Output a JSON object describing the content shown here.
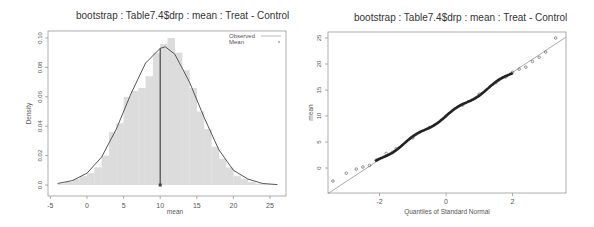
{
  "chart_data": [
    {
      "type": "bar",
      "subtype": "histogram_with_density",
      "title": "bootstrap : Table7.4$drp : mean : Treat - Control",
      "xlabel": "mean",
      "ylabel": "Density",
      "xlim": [
        -5,
        27
      ],
      "ylim": [
        0,
        0.104
      ],
      "x_ticks": [
        "-5",
        "0",
        "5",
        "10",
        "15",
        "20",
        "25"
      ],
      "y_ticks": [
        "0.0",
        "0.02",
        "0.04",
        "0.06",
        "0.08",
        "0.10"
      ],
      "grid": false,
      "legend": {
        "position": "top-right",
        "entries": [
          "Observed",
          "Mean"
        ]
      },
      "bins": [
        -4,
        -3,
        -2,
        -1,
        0,
        1,
        2,
        3,
        4,
        5,
        6,
        7,
        8,
        9,
        10,
        11,
        12,
        13,
        14,
        15,
        16,
        17,
        18,
        19,
        20,
        21,
        22,
        23,
        24,
        25
      ],
      "values": [
        0.001,
        0.002,
        0.004,
        0.006,
        0.008,
        0.012,
        0.02,
        0.036,
        0.042,
        0.06,
        0.064,
        0.066,
        0.074,
        0.09,
        0.096,
        0.1,
        0.09,
        0.078,
        0.066,
        0.05,
        0.038,
        0.026,
        0.018,
        0.012,
        0.006,
        0.004,
        0.002,
        0.001,
        0.0005,
        0.0003
      ],
      "density_curve": {
        "x": [
          -4,
          -2,
          0,
          2,
          4,
          6,
          8,
          10,
          10.7,
          12,
          14,
          16,
          18,
          20,
          22,
          24,
          26
        ],
        "y": [
          0.001,
          0.003,
          0.008,
          0.019,
          0.038,
          0.062,
          0.083,
          0.093,
          0.094,
          0.089,
          0.07,
          0.046,
          0.024,
          0.01,
          0.004,
          0.001,
          0.0003
        ]
      },
      "observed": 10,
      "mean": 10
    },
    {
      "type": "scatter",
      "subtype": "qq_plot",
      "title": "bootstrap : Table7.4$drp : mean : Treat - Control",
      "xlabel": "Quantiles of Standard Normal",
      "ylabel": "mean",
      "xlim": [
        -3.6,
        3.6
      ],
      "ylim": [
        -3.5,
        26
      ],
      "x_ticks": [
        "-2",
        "0",
        "2"
      ],
      "y_ticks": [
        "0",
        "5",
        "10",
        "15",
        "20",
        "25"
      ],
      "grid": false,
      "reference_line": {
        "intercept": 10,
        "slope": 4.2
      },
      "points": {
        "x": [
          -3.4,
          -3.0,
          -2.7,
          -2.5,
          -2.3,
          -2.1,
          -1.8,
          -1.5,
          -1.0,
          -0.5,
          0,
          0.5,
          1.0,
          1.5,
          1.8,
          2.0,
          2.2,
          2.4,
          2.6,
          2.8,
          3.0,
          3.3
        ],
        "y": [
          -2.5,
          -1.0,
          -0.2,
          0.2,
          0.5,
          1.5,
          2.8,
          3.7,
          5.8,
          7.8,
          10,
          12.1,
          14.2,
          16.4,
          17.5,
          18.4,
          19.0,
          19.4,
          20.5,
          21.3,
          22.3,
          25.0
        ]
      }
    }
  ],
  "left": {
    "title": "bootstrap : Table7.4$drp : mean : Treat - Control",
    "xlabel": "mean",
    "ylabel": "Density",
    "legend": {
      "observed": "Observed",
      "mean": "Mean"
    }
  },
  "right": {
    "title": "bootstrap : Table7.4$drp : mean : Treat - Control",
    "xlabel": "Quantiles of Standard Normal",
    "ylabel": "mean"
  },
  "colors": {
    "bars": "#dcdcdc",
    "curve": "#555555",
    "points": "#333333",
    "frame": "#999999",
    "text": "#555555"
  }
}
